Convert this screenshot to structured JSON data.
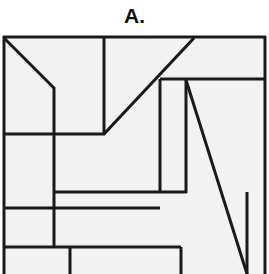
{
  "figure": {
    "label": "A.",
    "kind": "line-partition-diagram",
    "colors": {
      "stroke": "#1a1a1a",
      "fill": "#f2f2f2",
      "background": "#ffffff",
      "label": "#111111"
    },
    "frame": {
      "x": 3,
      "y": 36,
      "width": 263,
      "height": 238,
      "stroke_width": 3
    },
    "segments": [
      {
        "name": "outer-frame-top",
        "x1": 3,
        "y1": 37,
        "x2": 266,
        "y2": 37,
        "w": 3
      },
      {
        "name": "outer-frame-left",
        "x1": 4,
        "y1": 36,
        "x2": 4,
        "y2": 274,
        "w": 3
      },
      {
        "name": "outer-frame-right",
        "x1": 265,
        "y1": 36,
        "x2": 265,
        "y2": 274,
        "w": 3
      },
      {
        "name": "diagonal-top-left",
        "x1": 4,
        "y1": 38,
        "x2": 54,
        "y2": 88,
        "w": 3
      },
      {
        "name": "vertical-upper-left",
        "x1": 54,
        "y1": 87,
        "x2": 54,
        "y2": 134,
        "w": 3
      },
      {
        "name": "vertical-upper-mid",
        "x1": 104,
        "y1": 37,
        "x2": 104,
        "y2": 134,
        "w": 3
      },
      {
        "name": "diagonal-main-up",
        "x1": 104,
        "y1": 134,
        "x2": 194,
        "y2": 38,
        "w": 3
      },
      {
        "name": "horizontal-band-upper",
        "x1": 4,
        "y1": 134,
        "x2": 105,
        "y2": 134,
        "w": 3
      },
      {
        "name": "horizontal-right-upper",
        "x1": 160,
        "y1": 79,
        "x2": 265,
        "y2": 79,
        "w": 3
      },
      {
        "name": "vertical-right-a",
        "x1": 160,
        "y1": 79,
        "x2": 160,
        "y2": 193,
        "w": 3
      },
      {
        "name": "vertical-right-b",
        "x1": 186,
        "y1": 79,
        "x2": 186,
        "y2": 193,
        "w": 3
      },
      {
        "name": "diagonal-long-down",
        "x1": 186,
        "y1": 80,
        "x2": 247,
        "y2": 274,
        "w": 3
      },
      {
        "name": "vertical-mid-left",
        "x1": 54,
        "y1": 134,
        "x2": 54,
        "y2": 248,
        "w": 3
      },
      {
        "name": "horizontal-mid-192",
        "x1": 54,
        "y1": 192,
        "x2": 187,
        "y2": 192,
        "w": 3
      },
      {
        "name": "horizontal-mid-208",
        "x1": 4,
        "y1": 208,
        "x2": 160,
        "y2": 208,
        "w": 3
      },
      {
        "name": "vertical-right-c",
        "x1": 247,
        "y1": 192,
        "x2": 247,
        "y2": 274,
        "w": 3
      },
      {
        "name": "horizontal-low-247",
        "x1": 4,
        "y1": 247,
        "x2": 181,
        "y2": 247,
        "w": 3
      },
      {
        "name": "vertical-low-left",
        "x1": 70,
        "y1": 247,
        "x2": 70,
        "y2": 274,
        "w": 3
      },
      {
        "name": "vertical-low-right",
        "x1": 181,
        "y1": 247,
        "x2": 181,
        "y2": 274,
        "w": 3
      }
    ]
  }
}
